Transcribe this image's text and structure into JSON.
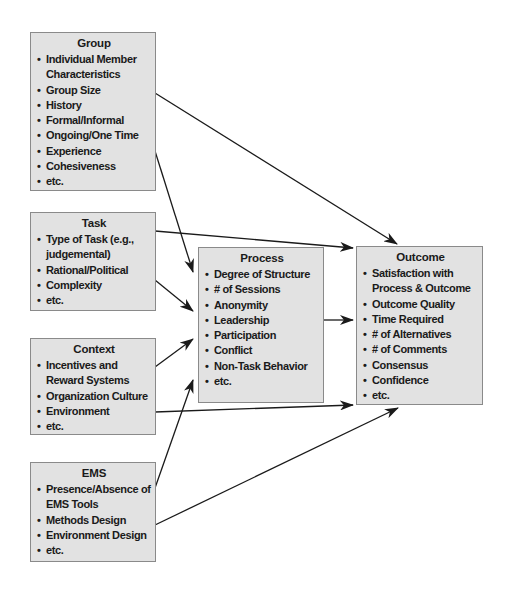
{
  "diagram": {
    "nodes": {
      "group": {
        "title": "Group",
        "items": [
          "Individual Member Characteristics",
          "Group Size",
          "History",
          "Formal/Informal",
          "Ongoing/One Time",
          "Experience",
          "Cohesiveness",
          "etc."
        ]
      },
      "task": {
        "title": "Task",
        "items": [
          "Type of Task (e.g., judgemental)",
          "Rational/Political",
          "Complexity",
          "etc."
        ]
      },
      "context": {
        "title": "Context",
        "items": [
          "Incentives and Reward Systems",
          "Organization Culture",
          "Environment",
          "etc."
        ]
      },
      "ems": {
        "title": "EMS",
        "items": [
          "Presence/Absence of EMS Tools",
          "Methods Design",
          "Environment Design",
          "etc."
        ]
      },
      "process": {
        "title": "Process",
        "items": [
          "Degree of Structure",
          "# of Sessions",
          "Anonymity",
          "Leadership",
          "Participation",
          "Conflict",
          "Non-Task Behavior",
          "etc."
        ]
      },
      "outcome": {
        "title": "Outcome",
        "items": [
          "Satisfaction with Process & Outcome",
          "Outcome Quality",
          "Time Required",
          "# of Alternatives",
          "# of Comments",
          "Consensus",
          "Confidence",
          "etc."
        ]
      }
    },
    "edges": [
      {
        "from": "group",
        "to": "outcome"
      },
      {
        "from": "group",
        "to": "process"
      },
      {
        "from": "task",
        "to": "outcome"
      },
      {
        "from": "task",
        "to": "process"
      },
      {
        "from": "context",
        "to": "process"
      },
      {
        "from": "context",
        "to": "outcome"
      },
      {
        "from": "ems",
        "to": "process"
      },
      {
        "from": "ems",
        "to": "outcome"
      },
      {
        "from": "process",
        "to": "outcome"
      }
    ],
    "bullet": "•",
    "colors": {
      "box_fill": "#e2e2e2",
      "box_border": "#8a8a8a",
      "line": "#1a1a1a",
      "text": "#1a1a1a"
    }
  }
}
